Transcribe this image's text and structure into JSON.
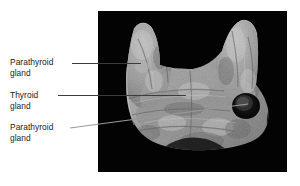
{
  "figure": {
    "type": "anatomical-photograph",
    "background_color": "#ffffff",
    "photo_background_color": "#030303",
    "label_color": "#1a1a1a",
    "leader_color": "#3c3c3c"
  },
  "labels": {
    "parathyroid_upper": {
      "line1": "Parathyroid",
      "line2": "gland"
    },
    "thyroid": {
      "line1": "Thyroid",
      "line2": "gland"
    },
    "parathyroid_lower": {
      "line1": "Parathyroid",
      "line2": "gland"
    }
  }
}
